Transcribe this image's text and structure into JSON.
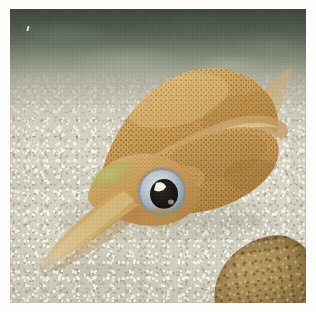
{
  "photo": {
    "subject": "squid",
    "caption": "",
    "border_color": "#fdfdfb",
    "border_width_px": 10
  },
  "scene": {
    "name": "squid-over-sandy-seabed",
    "environment": "underwater",
    "background": {
      "water": {
        "name": "water-column",
        "top_color": "#3e493c",
        "mid_color": "#848b79",
        "fade_color": "#c4c2b2"
      },
      "seabed": {
        "name": "sandy-seabed",
        "base_color": "#dad7c8",
        "shadow_color": "#7a7460",
        "grain_light": "#fffffa",
        "grain_dark": "#847c6c"
      },
      "rock": {
        "name": "rock-bottom-right",
        "color": "#a68850",
        "shade_color": "#6f5a34"
      }
    }
  },
  "squid": {
    "name": "squid",
    "body_color": "#c89a52",
    "body_highlight": "#e0bd7c",
    "body_shadow": "#9c7436",
    "fin_color": "#cfa863",
    "fin_translucent": "#d8c296",
    "speckle_color": "#6b4a1c",
    "parts": {
      "mantle": "mantle",
      "fin": "lateral-fin",
      "fin_tip": "fin-tip",
      "head": "head",
      "eye": "eye",
      "arms": "arms"
    },
    "eye": {
      "iris_color": "#b9c4cc",
      "iris_ring_color": "#8fa0ab",
      "pupil_color": "#1d1a17",
      "highlight_color": "#fbfbf6"
    },
    "iridescent_patch_color": "#a3ab5c"
  }
}
